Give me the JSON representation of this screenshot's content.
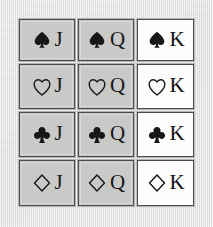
{
  "board": {
    "title": "Playing card grid",
    "background_color": "#e9e9e7",
    "columns": 3,
    "rows": 4,
    "rank_columns": [
      "J",
      "Q",
      "K"
    ],
    "suit_rows": [
      "spade",
      "heart",
      "club",
      "diamond"
    ],
    "card_colors": {
      "gray": "#c9c9c7",
      "white": "#fdfdfd",
      "border": "#4c4c4c",
      "glyph": "#17171a"
    }
  },
  "cards": [
    {
      "rank": "J",
      "suit": "spade",
      "suit_symbol": "♠",
      "suit_icon": "spade-filled-icon",
      "fill": "gray",
      "filled": true
    },
    {
      "rank": "Q",
      "suit": "spade",
      "suit_symbol": "♠",
      "suit_icon": "spade-filled-icon",
      "fill": "gray",
      "filled": true
    },
    {
      "rank": "K",
      "suit": "spade",
      "suit_symbol": "♠",
      "suit_icon": "spade-filled-icon",
      "fill": "white",
      "filled": true
    },
    {
      "rank": "J",
      "suit": "heart",
      "suit_symbol": "♡",
      "suit_icon": "heart-outline-icon",
      "fill": "gray",
      "filled": false
    },
    {
      "rank": "Q",
      "suit": "heart",
      "suit_symbol": "♡",
      "suit_icon": "heart-outline-icon",
      "fill": "gray",
      "filled": false
    },
    {
      "rank": "K",
      "suit": "heart",
      "suit_symbol": "♡",
      "suit_icon": "heart-outline-icon",
      "fill": "white",
      "filled": false
    },
    {
      "rank": "J",
      "suit": "club",
      "suit_symbol": "♣",
      "suit_icon": "club-filled-icon",
      "fill": "gray",
      "filled": true
    },
    {
      "rank": "Q",
      "suit": "club",
      "suit_symbol": "♣",
      "suit_icon": "club-filled-icon",
      "fill": "gray",
      "filled": true
    },
    {
      "rank": "K",
      "suit": "club",
      "suit_symbol": "♣",
      "suit_icon": "club-filled-icon",
      "fill": "white",
      "filled": true
    },
    {
      "rank": "J",
      "suit": "diamond",
      "suit_symbol": "♢",
      "suit_icon": "diamond-outline-icon",
      "fill": "gray",
      "filled": false
    },
    {
      "rank": "Q",
      "suit": "diamond",
      "suit_symbol": "♢",
      "suit_icon": "diamond-outline-icon",
      "fill": "gray",
      "filled": false
    },
    {
      "rank": "K",
      "suit": "diamond",
      "suit_symbol": "♢",
      "suit_icon": "diamond-outline-icon",
      "fill": "white",
      "filled": false
    }
  ]
}
